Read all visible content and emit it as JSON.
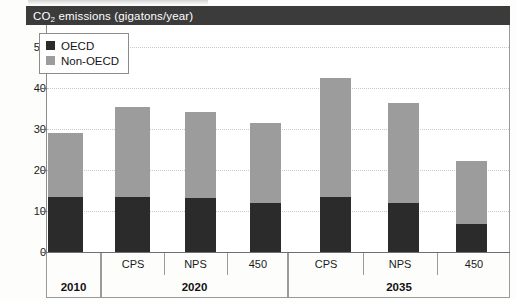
{
  "title": {
    "text": "CO2 emissions (gigatons/year)",
    "prefix": "CO",
    "subscript": "2",
    "suffix": " emissions (gigatons/year)",
    "band_color": "#3b3b3b",
    "text_color": "#ffffff"
  },
  "legend": {
    "position": "top-left-inside",
    "items": [
      {
        "label": "OECD",
        "color": "#2b2b2b",
        "swatch": "square-swatch"
      },
      {
        "label": "Non-OECD",
        "color": "#9c9c9c",
        "swatch": "square-swatch"
      }
    ]
  },
  "axes": {
    "y_ticks": [
      "0",
      "10",
      "20",
      "30",
      "40",
      "50"
    ],
    "y_min": 0,
    "y_max": 55,
    "y_label": "",
    "x_label": ""
  },
  "x_groups": [
    {
      "label": "2010",
      "scenarios": [
        ""
      ]
    },
    {
      "label": "2020",
      "scenarios": [
        "CPS",
        "NPS",
        "450"
      ]
    },
    {
      "label": "2035",
      "scenarios": [
        "CPS",
        "NPS",
        "450"
      ]
    }
  ],
  "chart_data": {
    "type": "bar",
    "subtype": "stacked",
    "title": "CO2 emissions (gigatons/year)",
    "xlabel": "",
    "ylabel": "CO2 emissions (gigatons/year)",
    "ylim": [
      0,
      55
    ],
    "yticks": [
      0,
      10,
      20,
      30,
      40,
      50
    ],
    "grid": true,
    "grid_style": "dotted horizontal",
    "legend_position": "top-left inside plot",
    "categories": [
      "2010",
      "2020 CPS",
      "2020 NPS",
      "2020 450",
      "2035 CPS",
      "2035 NPS",
      "2035 450"
    ],
    "group_labels": [
      "2010",
      "2020",
      "2035"
    ],
    "scenario_labels": [
      "",
      "CPS",
      "NPS",
      "450",
      "CPS",
      "NPS",
      "450"
    ],
    "series": [
      {
        "name": "OECD",
        "color": "#2b2b2b",
        "values": [
          13.4,
          13.4,
          13.1,
          12.0,
          13.4,
          11.9,
          6.8
        ]
      },
      {
        "name": "Non-OECD",
        "color": "#9c9c9c",
        "values": [
          15.7,
          22.0,
          21.0,
          19.5,
          29.0,
          24.4,
          15.5
        ]
      }
    ],
    "totals": [
      29.1,
      35.4,
      34.1,
      31.5,
      42.4,
      36.3,
      22.3
    ]
  },
  "bars": [
    {
      "name": "2010",
      "x": 48,
      "width": 35,
      "oecd": 13.4,
      "nonoecd": 15.7,
      "total": 29.1
    },
    {
      "name": "2020-CPS",
      "x": 115,
      "width": 35,
      "oecd": 13.4,
      "nonoecd": 22.0,
      "total": 35.4
    },
    {
      "name": "2020-NPS",
      "x": 185,
      "width": 31,
      "oecd": 13.1,
      "nonoecd": 21.0,
      "total": 34.1
    },
    {
      "name": "2020-450",
      "x": 250,
      "width": 31,
      "oecd": 12.0,
      "nonoecd": 19.5,
      "total": 31.5
    },
    {
      "name": "2035-CPS",
      "x": 320,
      "width": 31,
      "oecd": 13.4,
      "nonoecd": 29.0,
      "total": 42.4
    },
    {
      "name": "2035-NPS",
      "x": 388,
      "width": 31,
      "oecd": 11.9,
      "nonoecd": 24.4,
      "total": 36.3
    },
    {
      "name": "2035-450",
      "x": 456,
      "width": 31,
      "oecd": 6.8,
      "nonoecd": 15.5,
      "total": 22.3
    }
  ]
}
